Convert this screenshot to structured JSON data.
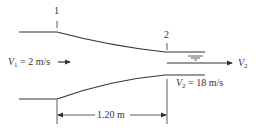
{
  "diagram": {
    "type": "nozzle-flow",
    "section_labels": {
      "section1": "1",
      "section2": "2"
    },
    "inlet_velocity": {
      "symbol": "V",
      "subscript": "1",
      "value_text": " = 2 m/s"
    },
    "outlet_velocity_arrow": {
      "symbol": "V",
      "subscript": "2"
    },
    "outlet_velocity_value": {
      "symbol": "V",
      "subscript": "2",
      "value_text": " = 18 m/s"
    },
    "dimension": {
      "label": "1.20 m"
    },
    "colors": {
      "line": "#333333",
      "background": "#ffffff"
    }
  }
}
